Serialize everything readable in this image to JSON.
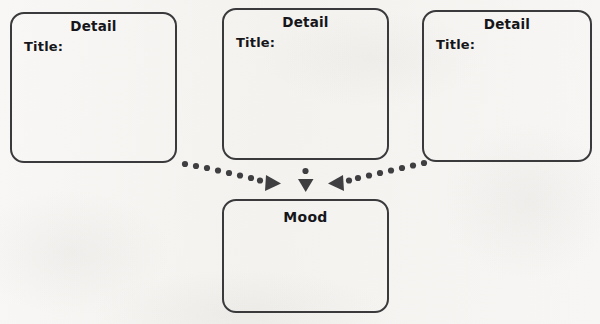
{
  "canvas": {
    "width": 600,
    "height": 324,
    "background": "#f6f5f3"
  },
  "theme": {
    "stroke": "#3a3a3c",
    "text": "#16161a",
    "connector": "#3f3f41"
  },
  "diagram": {
    "type": "graphic-organizer",
    "detail_nodes": [
      {
        "id": "detail-1",
        "heading": "Detail",
        "field_label": "Title:",
        "value": "",
        "x": 10,
        "y": 12,
        "width": 167,
        "height": 151
      },
      {
        "id": "detail-2",
        "heading": "Detail",
        "field_label": "Title:",
        "value": "",
        "x": 222,
        "y": 8,
        "width": 167,
        "height": 152
      },
      {
        "id": "detail-3",
        "heading": "Detail",
        "field_label": "Title:",
        "value": "",
        "x": 422,
        "y": 10,
        "width": 170,
        "height": 152
      }
    ],
    "mood_node": {
      "id": "mood",
      "heading": "Mood",
      "value": "",
      "x": 222,
      "y": 199,
      "width": 167,
      "height": 114
    },
    "connectors": [
      {
        "id": "connector-left",
        "from": "detail-1",
        "to": "mood",
        "style": "dotted",
        "arrow": "triangle"
      },
      {
        "id": "connector-center",
        "from": "detail-2",
        "to": "mood",
        "style": "dotted",
        "arrow": "triangle"
      },
      {
        "id": "connector-right",
        "from": "detail-3",
        "to": "mood",
        "style": "dotted",
        "arrow": "triangle"
      }
    ]
  }
}
